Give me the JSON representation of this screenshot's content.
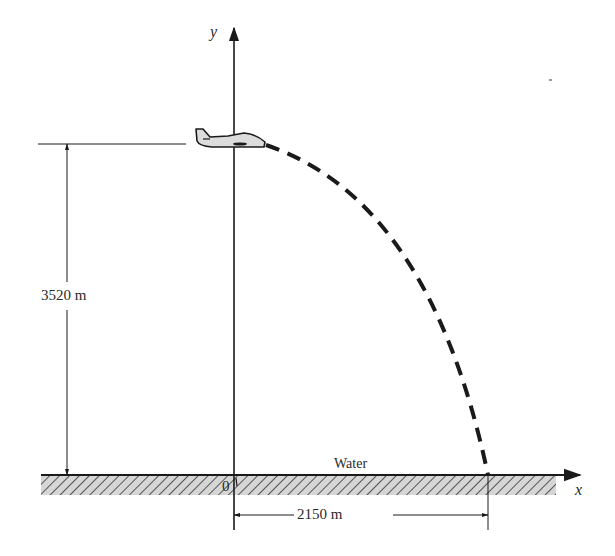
{
  "figure": {
    "type": "projectile-motion-diagram",
    "axes": {
      "x_label": "x",
      "y_label": "y",
      "origin_label": "0"
    },
    "surface_label": "Water",
    "height": {
      "value": 3520,
      "unit": "m",
      "label": "3520 m"
    },
    "range": {
      "value": 2150,
      "unit": "m",
      "label": "2150 m"
    },
    "objects": [
      {
        "name": "airplane",
        "icon": "airplane-icon"
      },
      {
        "name": "trajectory",
        "style": "dashed parabola"
      }
    ],
    "colors": {
      "line": "#1a1a1a",
      "text": "#2a2a2a",
      "hatch_fill": "#d6d6d6",
      "plane_fill": "#dcdcdc"
    }
  }
}
